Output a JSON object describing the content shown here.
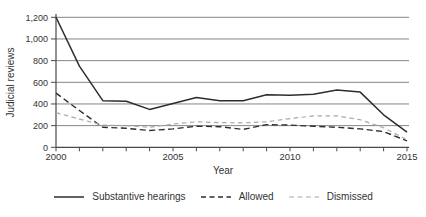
{
  "chart_data": {
    "type": "line",
    "title": "",
    "xlabel": "Year",
    "ylabel": "Judicial reviews",
    "x": [
      2000,
      2001,
      2002,
      2003,
      2004,
      2005,
      2006,
      2007,
      2008,
      2009,
      2010,
      2011,
      2012,
      2013,
      2014,
      2015
    ],
    "series": [
      {
        "name": "Substantive hearings",
        "style": "solid",
        "color": "#2d2d2d",
        "dash": "",
        "width": 1.5,
        "values": [
          1200,
          750,
          430,
          425,
          350,
          405,
          460,
          430,
          430,
          485,
          480,
          490,
          530,
          510,
          300,
          140
        ]
      },
      {
        "name": "Allowed",
        "style": "dashed",
        "color": "#2d2d2d",
        "dash": "6 3.5",
        "width": 1.4,
        "values": [
          500,
          340,
          185,
          175,
          155,
          170,
          195,
          190,
          165,
          210,
          205,
          195,
          185,
          170,
          145,
          60
        ]
      },
      {
        "name": "Dismissed",
        "style": "dashed",
        "color": "#a8a8a8",
        "dash": "4.5 3.5",
        "width": 1.2,
        "values": [
          320,
          260,
          205,
          200,
          185,
          215,
          235,
          228,
          225,
          235,
          265,
          290,
          290,
          255,
          180,
          70
        ]
      }
    ],
    "ylim": [
      0,
      1200
    ],
    "yticks": [
      0,
      200,
      400,
      600,
      800,
      1000,
      1200
    ],
    "ytick_labels": [
      "0",
      "200",
      "400",
      "600",
      "800",
      "1,000",
      "1,200"
    ],
    "xticks": [
      2000,
      2005,
      2010,
      2015
    ],
    "xtick_labels": [
      "2000",
      "2005",
      "2010",
      "2015"
    ],
    "grid": "horizontal",
    "legend_position": "bottom"
  },
  "colors": {
    "background": "#ffffff",
    "gridline": "#858585",
    "axis": "#4a4a4a",
    "text": "#333333"
  }
}
